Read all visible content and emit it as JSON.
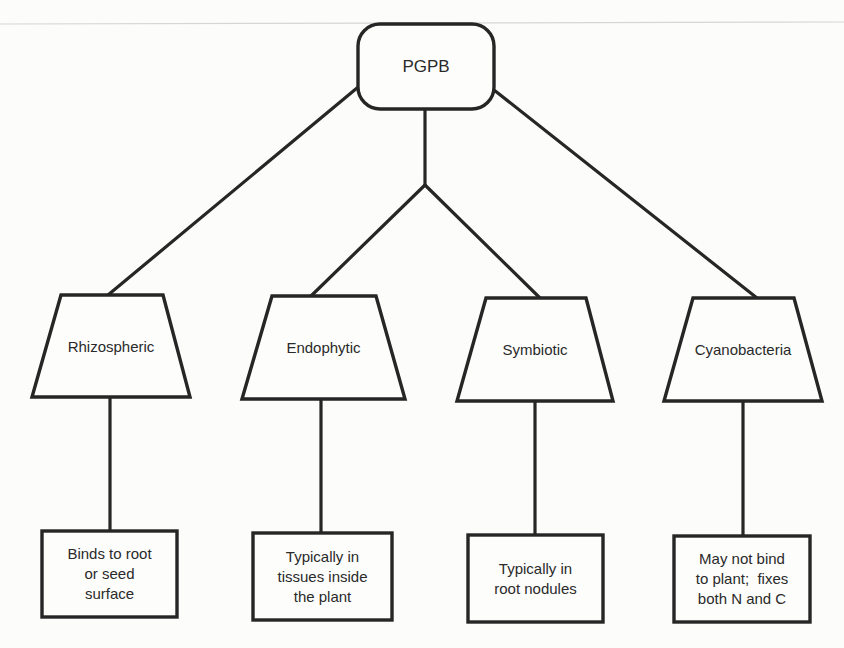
{
  "diagram": {
    "type": "hierarchy-tree",
    "colors": {
      "background": "#fcfcfb",
      "stroke": "#262626",
      "text": "#2a2a2a",
      "scan_artifact_line": "#d4d4d4"
    },
    "root": {
      "id": "pgpb",
      "label": "PGPB",
      "shape": "rounded-rectangle"
    },
    "categories": [
      {
        "id": "rhizospheric",
        "label": "Rhizospheric",
        "shape": "trapezoid",
        "description": "Binds to root or seed surface",
        "description_lines": [
          "Binds to root",
          "or seed",
          "surface"
        ]
      },
      {
        "id": "endophytic",
        "label": "Endophytic",
        "shape": "trapezoid",
        "description": "Typically in tissues inside the plant",
        "description_lines": [
          "Typically in",
          "tissues inside",
          "the plant"
        ]
      },
      {
        "id": "symbiotic",
        "label": "Symbiotic",
        "shape": "trapezoid",
        "description": "Typically in root nodules",
        "description_lines": [
          "Typically in",
          "root nodules"
        ]
      },
      {
        "id": "cyanobacteria",
        "label": "Cyanobacteria",
        "shape": "trapezoid",
        "description": "May not bind to plant; fixes both N and C",
        "description_lines": [
          "May not bind",
          "to plant;  fixes",
          "both N and C"
        ]
      }
    ],
    "edges": [
      {
        "from": "pgpb",
        "to": "rhizospheric"
      },
      {
        "from": "pgpb",
        "to": "endophytic",
        "via": "junction"
      },
      {
        "from": "pgpb",
        "to": "symbiotic",
        "via": "junction"
      },
      {
        "from": "pgpb",
        "to": "cyanobacteria"
      },
      {
        "from": "rhizospheric",
        "to": "rhizospheric-description"
      },
      {
        "from": "endophytic",
        "to": "endophytic-description"
      },
      {
        "from": "symbiotic",
        "to": "symbiotic-description"
      },
      {
        "from": "cyanobacteria",
        "to": "cyanobacteria-description"
      }
    ]
  }
}
